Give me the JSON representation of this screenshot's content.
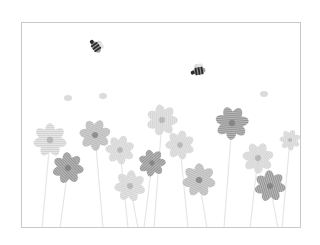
{
  "image": {
    "kind": "illustration",
    "description": "Grayscale watercolor-style illustration of a meadow of daisy-like flowers with two bees flying above, inside a thin rectangular frame",
    "palette": {
      "background": "#ffffff",
      "frame_border": "#c9c9c9",
      "flower_light": "#d2d2d2",
      "flower_mid": "#b4b4b4",
      "flower_dark": "#8c8c8c",
      "flower_center": "#6e6e6e",
      "bee": "#2b2b2b",
      "stem": "#e6e6e6"
    },
    "frame": {
      "x": 21,
      "y": 22,
      "width": 280,
      "height": 206
    },
    "bees": [
      {
        "name": "bee-left",
        "x": 96,
        "y": 47,
        "rotation": 55
      },
      {
        "name": "bee-right",
        "x": 199,
        "y": 71,
        "rotation": -10
      }
    ],
    "flowers": [
      {
        "x": 50,
        "y": 140,
        "r": 16,
        "tone": "light"
      },
      {
        "x": 95,
        "y": 135,
        "r": 15,
        "tone": "mid"
      },
      {
        "x": 68,
        "y": 168,
        "r": 15,
        "tone": "dark"
      },
      {
        "x": 120,
        "y": 150,
        "r": 14,
        "tone": "light"
      },
      {
        "x": 162,
        "y": 120,
        "r": 15,
        "tone": "light"
      },
      {
        "x": 180,
        "y": 145,
        "r": 14,
        "tone": "light"
      },
      {
        "x": 152,
        "y": 163,
        "r": 13,
        "tone": "dark"
      },
      {
        "x": 130,
        "y": 186,
        "r": 15,
        "tone": "light"
      },
      {
        "x": 232,
        "y": 123,
        "r": 16,
        "tone": "dark"
      },
      {
        "x": 199,
        "y": 180,
        "r": 16,
        "tone": "mid"
      },
      {
        "x": 258,
        "y": 158,
        "r": 15,
        "tone": "light"
      },
      {
        "x": 270,
        "y": 186,
        "r": 15,
        "tone": "dark"
      },
      {
        "x": 290,
        "y": 140,
        "r": 10,
        "tone": "light"
      }
    ],
    "small_buds": [
      {
        "x": 103,
        "y": 96
      },
      {
        "x": 264,
        "y": 94
      },
      {
        "x": 68,
        "y": 98
      }
    ]
  }
}
